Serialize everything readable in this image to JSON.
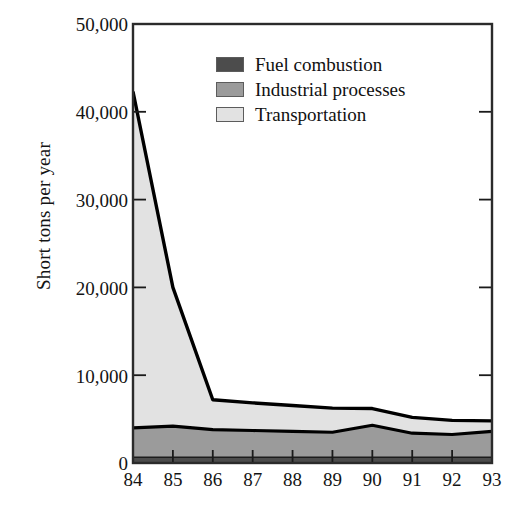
{
  "chart_data": {
    "type": "area",
    "stacked": true,
    "title": "",
    "subtitle": "",
    "xlabel": "",
    "ylabel": "Short tons per year",
    "x": [
      84,
      85,
      86,
      87,
      88,
      89,
      90,
      91,
      92,
      93
    ],
    "categories": [
      "84",
      "85",
      "86",
      "87",
      "88",
      "89",
      "90",
      "91",
      "92",
      "93"
    ],
    "xtick_labels": [
      "84",
      "85",
      "86",
      "87",
      "88",
      "89",
      "90",
      "91",
      "92",
      "93"
    ],
    "ytick_labels": [
      "0",
      "10,000",
      "20,000",
      "30,000",
      "40,000",
      "50,000"
    ],
    "ytick_values": [
      0,
      10000,
      20000,
      30000,
      40000,
      50000
    ],
    "ylim": [
      0,
      50000
    ],
    "xlim": [
      84,
      93
    ],
    "grid": false,
    "legend_position": "upper-center",
    "series": [
      {
        "name": "Fuel combustion",
        "color": "#4c4c4c",
        "values": [
          650,
          650,
          650,
          650,
          650,
          650,
          650,
          650,
          650,
          650
        ]
      },
      {
        "name": "Industrial processes",
        "color": "#9b9b9b",
        "values": [
          3350,
          3550,
          3150,
          3050,
          2950,
          2850,
          3650,
          2750,
          2600,
          2950
        ]
      },
      {
        "name": "Transportation",
        "color": "#e2e2e2",
        "values": [
          38300,
          15800,
          3400,
          3150,
          2950,
          2750,
          1900,
          1800,
          1600,
          1200
        ]
      }
    ],
    "totals": [
      42300,
      20000,
      7200,
      6850,
      6550,
      6250,
      6200,
      5200,
      4850,
      4800
    ],
    "cumulative": {
      "fuel_combustion_top": [
        650,
        650,
        650,
        650,
        650,
        650,
        650,
        650,
        650,
        650
      ],
      "industrial_processes_top": [
        4000,
        4200,
        3800,
        3700,
        3600,
        3500,
        4300,
        3400,
        3250,
        3600
      ],
      "transportation_top": [
        42300,
        20000,
        7200,
        6850,
        6550,
        6250,
        6200,
        5200,
        4850,
        4800
      ]
    }
  },
  "legend": {
    "items": [
      {
        "label": "Fuel combustion",
        "color": "#4c4c4c"
      },
      {
        "label": "Industrial processes",
        "color": "#9b9b9b"
      },
      {
        "label": "Transportation",
        "color": "#e2e2e2"
      }
    ]
  },
  "axes": {
    "y_title": "Short tons per year",
    "y_labels": [
      "50,000",
      "40,000",
      "30,000",
      "20,000",
      "10,000",
      "0"
    ],
    "x_labels": [
      "84",
      "85",
      "86",
      "87",
      "88",
      "89",
      "90",
      "91",
      "92",
      "93"
    ]
  },
  "colors": {
    "axis": "#2b2b2b",
    "outline": "#000000",
    "background": "#ffffff"
  }
}
